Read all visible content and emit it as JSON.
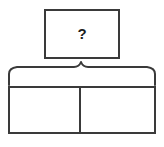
{
  "diagram": {
    "kind": "bar-model",
    "background_color": "#ffffff",
    "stroke_color": "#3a3a3a",
    "text_color": "#1d1d1d"
  },
  "whole": {
    "label": "?",
    "box": {
      "x": 44,
      "y": 9,
      "width": 75,
      "height": 49
    }
  },
  "brace": {
    "glyph_name": "curly-brace-up",
    "span_start_x": 8,
    "span_end_x": 156,
    "peak_x": 81,
    "peak_y": 62,
    "base_y": 85
  },
  "bar": {
    "x": 8,
    "y": 86,
    "width": 147,
    "height": 47,
    "divider_x": 80,
    "parts": [
      {
        "label": "",
        "name": "part-left"
      },
      {
        "label": "",
        "name": "part-right"
      }
    ]
  }
}
